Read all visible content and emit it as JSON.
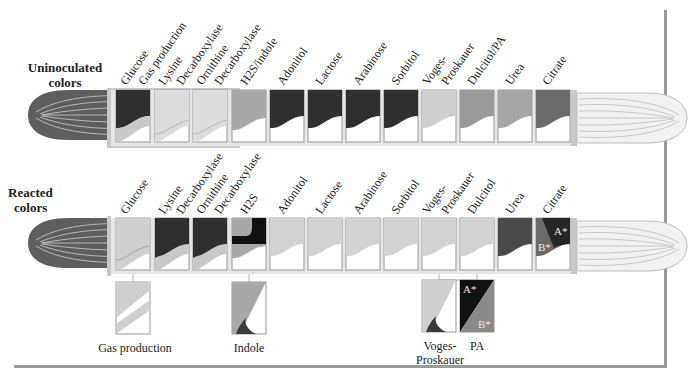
{
  "rows": {
    "uninoculated": {
      "title_line1": "Uninoculated",
      "title_line2": "colors",
      "labels": [
        "Glucose",
        "Gas production",
        "Lysine",
        "Decarboxylase",
        "Ornithine",
        "Decarboxylase",
        "H2S/indole",
        "Adonitol",
        "Lactose",
        "Arabinose",
        "Sorbitol",
        "Voges-",
        "Proskauer",
        "Dulcitol/PA",
        "Urea",
        "Citrate"
      ]
    },
    "reacted": {
      "title_line1": "Reacted",
      "title_line2": "colors",
      "labels": [
        "Glucose",
        "Lysine",
        "Decarboxylase",
        "Ornithine",
        "Decarboxylase",
        "H2S",
        "Adonitol",
        "Lactose",
        "Arabinose",
        "Sorbitol",
        "Voges-",
        "Proskauer",
        "Dulcitol",
        "Urea",
        "Citrate"
      ],
      "citrate_markers": [
        "A*",
        "B*"
      ]
    }
  },
  "details": {
    "gas_production": "Gas production",
    "indole": "Indole",
    "voges_proskauer_line1": "Voges-",
    "voges_proskauer_line2": "Proskauer",
    "pa": "PA",
    "pa_markers": [
      "A*",
      "B*"
    ]
  },
  "colors": {
    "dark": "#2f2f2f",
    "medium": "#7a7a7a",
    "light": "#c9c9c9",
    "lighter": "#dcdcdc",
    "black": "#111111",
    "tube": "#b5b5b5"
  }
}
